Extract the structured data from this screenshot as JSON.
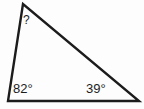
{
  "figure": {
    "type": "triangle-diagram",
    "background_color": "#fdfdfd",
    "stroke_color": "#1c1c1c",
    "text_color": "#1c1c1c",
    "vertices": {
      "apex": {
        "x": 23,
        "y": 4
      },
      "bottom_left": {
        "x": 8,
        "y": 101
      },
      "bottom_right": {
        "x": 139,
        "y": 101
      }
    },
    "labels": {
      "apex_angle": "?",
      "bottom_left_angle": "82°",
      "bottom_right_angle": "39°"
    }
  }
}
